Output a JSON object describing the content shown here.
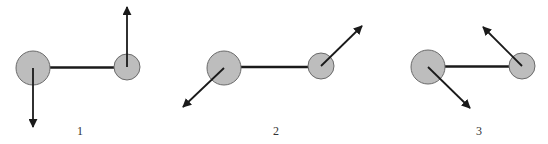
{
  "colors": {
    "atom_fill": "#bdbdbd",
    "atom_stroke": "#6a6a6a",
    "bond": "#1a1a1a",
    "arrow": "#1a1a1a",
    "label": "#333333"
  },
  "panels": [
    {
      "label": "1",
      "label_pos": [
        80,
        131
      ],
      "large_atom": {
        "cx": 33,
        "cy": 68,
        "r": 17
      },
      "small_atom": {
        "cx": 127,
        "cy": 67,
        "r": 13
      },
      "arrows": [
        {
          "from": [
            33,
            68
          ],
          "to": [
            33,
            127
          ],
          "direction": "down"
        },
        {
          "from": [
            127,
            67
          ],
          "to": [
            127,
            7
          ],
          "direction": "up"
        }
      ]
    },
    {
      "label": "2",
      "label_pos": [
        276,
        131
      ],
      "large_atom": {
        "cx": 224,
        "cy": 68,
        "r": 17
      },
      "small_atom": {
        "cx": 321,
        "cy": 66,
        "r": 13
      },
      "arrows": [
        {
          "from": [
            224,
            68
          ],
          "to": [
            183,
            107
          ],
          "direction": "down-left"
        },
        {
          "from": [
            321,
            66
          ],
          "to": [
            362,
            26
          ],
          "direction": "up-right"
        }
      ]
    },
    {
      "label": "3",
      "label_pos": [
        479,
        131
      ],
      "large_atom": {
        "cx": 428,
        "cy": 67,
        "r": 17
      },
      "small_atom": {
        "cx": 522,
        "cy": 66,
        "r": 13
      },
      "arrows": [
        {
          "from": [
            428,
            67
          ],
          "to": [
            470,
            108
          ],
          "direction": "down-right"
        },
        {
          "from": [
            522,
            66
          ],
          "to": [
            483,
            27
          ],
          "direction": "up-left"
        }
      ]
    }
  ]
}
